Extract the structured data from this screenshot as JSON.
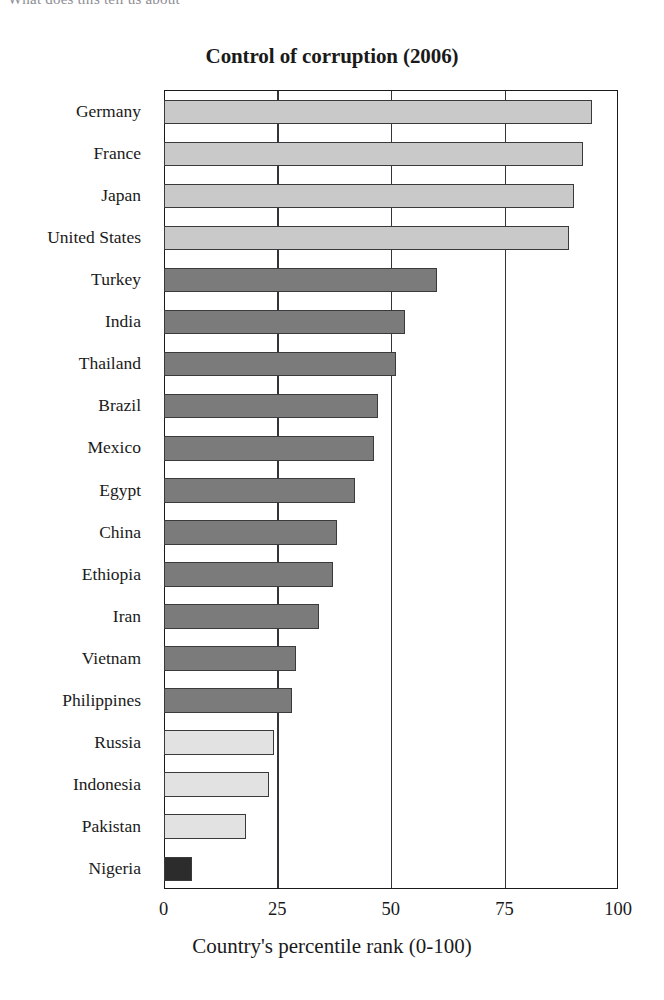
{
  "page": {
    "top_fragment_text": "What does this tell us about"
  },
  "chart_data": {
    "type": "bar",
    "orientation": "horizontal",
    "title": "Control of corruption (2006)",
    "xlabel": "Country's percentile rank (0-100)",
    "ylabel": "",
    "xlim": [
      0,
      100
    ],
    "xticks": [
      0,
      25,
      50,
      75,
      100
    ],
    "xtick_labels": [
      "0",
      "25",
      "50",
      "75",
      "100"
    ],
    "grid": "vertical gridlines at each x tick",
    "legend": "none",
    "categories": [
      "Germany",
      "France",
      "Japan",
      "United States",
      "Turkey",
      "India",
      "Thailand",
      "Brazil",
      "Mexico",
      "Egypt",
      "China",
      "Ethiopia",
      "Iran",
      "Vietnam",
      "Philippines",
      "Russia",
      "Indonesia",
      "Pakistan",
      "Nigeria"
    ],
    "values": [
      94,
      92,
      90,
      89,
      60,
      53,
      51,
      47,
      46,
      42,
      38,
      37,
      34,
      29,
      28,
      24,
      23,
      18,
      6
    ],
    "bar_colors": [
      "#c9c9c9",
      "#c9c9c9",
      "#c9c9c9",
      "#c9c9c9",
      "#7b7b7b",
      "#7b7b7b",
      "#7b7b7b",
      "#7b7b7b",
      "#7b7b7b",
      "#7b7b7b",
      "#7b7b7b",
      "#7b7b7b",
      "#7b7b7b",
      "#7b7b7b",
      "#7b7b7b",
      "#e2e2e2",
      "#e2e2e2",
      "#e2e2e2",
      "#2c2c2c"
    ],
    "bar_edge_color": "#3a3a3a",
    "axis_color": "#1a1a1a",
    "background": "#ffffff"
  }
}
